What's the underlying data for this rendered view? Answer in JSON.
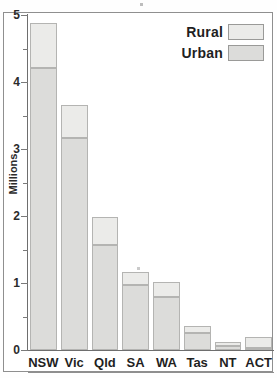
{
  "chart_data": {
    "type": "bar",
    "title": "",
    "subtitle": "",
    "xlabel": "",
    "ylabel": "Millions",
    "ylim": [
      0,
      5
    ],
    "yticks": [
      0,
      1,
      2,
      3,
      4,
      5
    ],
    "ytick_labels": [
      "0",
      "1",
      "2",
      "3",
      "4",
      "5"
    ],
    "yminor_ticks": [
      0.5,
      1.5,
      2.5,
      3.5,
      4.5
    ],
    "grid": false,
    "stacked": true,
    "legend_position": "top-right",
    "categories": [
      "NSW",
      "Vic",
      "Qld",
      "SA",
      "WA",
      "Tas",
      "NT",
      "ACT"
    ],
    "series": [
      {
        "name": "Urban",
        "color": "#dcdcda",
        "values": [
          4.21,
          3.16,
          1.57,
          0.97,
          0.79,
          0.25,
          0.06,
          0.03
        ]
      },
      {
        "name": "Rural",
        "color": "#ebebe9",
        "values": [
          0.67,
          0.5,
          0.42,
          0.19,
          0.22,
          0.11,
          0.06,
          0.16
        ]
      }
    ],
    "totals": [
      4.88,
      3.66,
      1.99,
      1.16,
      1.01,
      0.36,
      0.12,
      0.19
    ]
  },
  "axes": {
    "y_title": "Millions",
    "y_tick_labels": [
      "5",
      "4",
      "3",
      "2",
      "1",
      "0"
    ],
    "x_tick_labels": [
      "NSW",
      "Vic",
      "Qld",
      "SA",
      "WA",
      "Tas",
      "NT",
      "ACT"
    ]
  },
  "legend": {
    "entries": [
      {
        "label": "Rural",
        "swatch": "rural-swatch"
      },
      {
        "label": "Urban",
        "swatch": "urban-swatch"
      }
    ]
  },
  "colors": {
    "rural": "#ebebe9",
    "urban": "#dcdcda",
    "bar_border": "#b4b4b2",
    "axis": "#6e6e6e",
    "text": "#1f1f1f",
    "background": "#ffffff"
  }
}
